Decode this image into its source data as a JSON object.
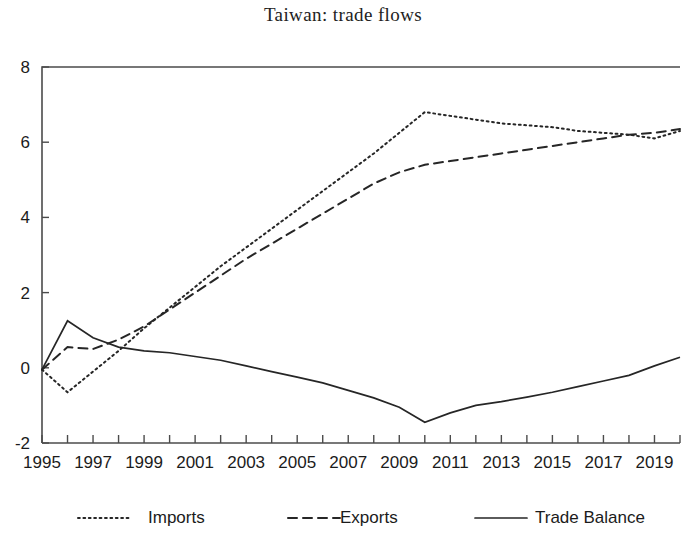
{
  "chart_data": {
    "type": "line",
    "title": "Taiwan: trade flows",
    "xlabel": "",
    "ylabel": "",
    "xlim": [
      1995,
      2020
    ],
    "ylim": [
      -2,
      8
    ],
    "y_ticks": [
      -2,
      0,
      2,
      4,
      6,
      8
    ],
    "x_ticks_major": [
      1995,
      1997,
      1999,
      2001,
      2003,
      2005,
      2007,
      2009,
      2011,
      2013,
      2015,
      2017,
      2019
    ],
    "x_ticks_minor": [
      1995,
      1996,
      1997,
      1998,
      1999,
      2000,
      2001,
      2002,
      2003,
      2004,
      2005,
      2006,
      2007,
      2008,
      2009,
      2010,
      2011,
      2012,
      2013,
      2014,
      2015,
      2016,
      2017,
      2018,
      2019,
      2020
    ],
    "grid": false,
    "legend_position": "bottom",
    "x": [
      1995,
      1996,
      1997,
      1998,
      1999,
      2000,
      2001,
      2002,
      2003,
      2004,
      2005,
      2006,
      2007,
      2008,
      2009,
      2010,
      2011,
      2012,
      2013,
      2014,
      2015,
      2016,
      2017,
      2018,
      2019,
      2020
    ],
    "series": [
      {
        "name": "Imports",
        "style": "dotted",
        "color": "#262626",
        "values": [
          -0.05,
          -0.65,
          -0.1,
          0.45,
          1.05,
          1.6,
          2.15,
          2.7,
          3.2,
          3.7,
          4.2,
          4.7,
          5.2,
          5.7,
          6.25,
          6.8,
          6.7,
          6.6,
          6.5,
          6.45,
          6.4,
          6.3,
          6.25,
          6.2,
          6.1,
          6.3
        ]
      },
      {
        "name": "Exports",
        "style": "dashed",
        "color": "#262626",
        "values": [
          -0.05,
          0.55,
          0.5,
          0.75,
          1.1,
          1.55,
          2.0,
          2.45,
          2.9,
          3.3,
          3.7,
          4.1,
          4.5,
          4.9,
          5.2,
          5.4,
          5.5,
          5.6,
          5.7,
          5.8,
          5.9,
          6.0,
          6.1,
          6.2,
          6.25,
          6.35
        ]
      },
      {
        "name": "Trade Balance",
        "style": "solid",
        "color": "#262626",
        "values": [
          -0.05,
          1.25,
          0.8,
          0.55,
          0.45,
          0.4,
          0.3,
          0.2,
          0.05,
          -0.1,
          -0.25,
          -0.4,
          -0.6,
          -0.8,
          -1.05,
          -1.45,
          -1.2,
          -1.0,
          -0.9,
          -0.78,
          -0.65,
          -0.5,
          -0.35,
          -0.2,
          0.05,
          0.28
        ]
      }
    ],
    "legend": [
      {
        "label": "Imports",
        "style": "dotted"
      },
      {
        "label": "Exports",
        "style": "dashed"
      },
      {
        "label": "Trade Balance",
        "style": "solid"
      }
    ]
  }
}
